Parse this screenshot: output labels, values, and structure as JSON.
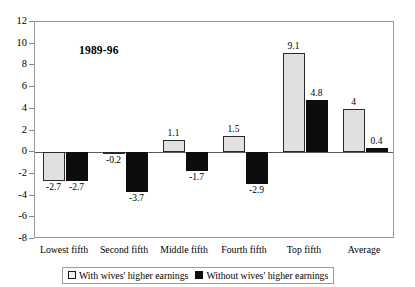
{
  "chart_data": {
    "type": "bar",
    "title": "1989-96",
    "xlabel": "",
    "ylabel": "",
    "ylim": [
      -8,
      12
    ],
    "ytick_step": 2,
    "yticks": [
      "12",
      "10",
      "8",
      "6",
      "4",
      "2",
      "0",
      "-2",
      "-4",
      "-6",
      "-8"
    ],
    "grid": false,
    "legend_position": "bottom",
    "categories": [
      "Lowest fifth",
      "Second fifth",
      "Middle fifth",
      "Fourth fifth",
      "Top fifth",
      "Average"
    ],
    "series": [
      {
        "name": "With wives' higher earnings",
        "color": "#e0e0e0",
        "values": [
          -2.7,
          -0.2,
          1.1,
          1.5,
          9.1,
          4
        ],
        "labels": [
          "-2.7",
          "-0.2",
          "1.1",
          "1.5",
          "9.1",
          "4"
        ]
      },
      {
        "name": "Without wives' higher earnings",
        "color": "#0d0d0d",
        "values": [
          -2.7,
          -3.7,
          -1.7,
          -2.9,
          4.8,
          0.4
        ],
        "labels": [
          "-2.7",
          "-3.7",
          "-1.7",
          "-2.9",
          "4.8",
          "0.4"
        ]
      }
    ]
  },
  "legend": {
    "items": [
      {
        "label": "With wives' higher earnings"
      },
      {
        "label": "Without wives' higher earnings"
      }
    ]
  },
  "colors": {
    "series_light": "#e0e0e0",
    "series_dark": "#0d0d0d",
    "axis": "#9a9a9a",
    "zero_line": "#5a5a5a"
  }
}
